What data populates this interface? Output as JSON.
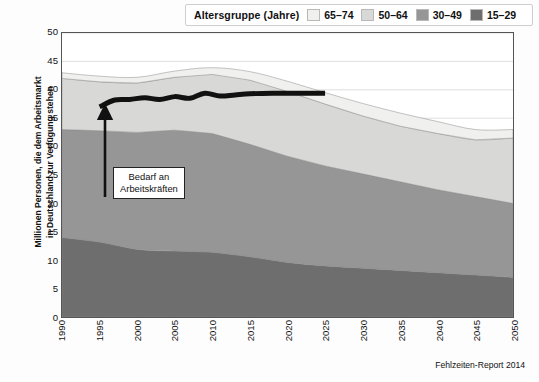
{
  "legend": {
    "title": "Altersgruppe (Jahre)",
    "items": [
      {
        "label": "65–74",
        "color": "#f0f0ee"
      },
      {
        "label": "50–64",
        "color": "#d8d8d6"
      },
      {
        "label": "30–49",
        "color": "#969696"
      },
      {
        "label": "15–29",
        "color": "#6e6e6e"
      }
    ]
  },
  "annotation": {
    "line1": "Bedarf an",
    "line2": "Arbeitskräften"
  },
  "footer": "Fehlzeiten-Report 2014",
  "chart_data": {
    "type": "area",
    "title": "",
    "xlabel": "",
    "ylabel": "Millionen Personen, die dem Arbeitsmarkt in Deutschland zur Verfügung stehen",
    "ylabel_line1": "Millionen Personen, die dem Arbeitsmarkt",
    "ylabel_line2": "in Deutschland zur Verfügung stehen",
    "stacked": true,
    "grid": true,
    "legend_position": "top",
    "xlim": [
      1990,
      2050
    ],
    "ylim": [
      0,
      50
    ],
    "yticks": [
      0,
      5,
      10,
      15,
      20,
      25,
      30,
      35,
      40,
      45,
      50
    ],
    "xticks": [
      1990,
      1995,
      2000,
      2005,
      2010,
      2015,
      2020,
      2025,
      2030,
      2035,
      2040,
      2045,
      2050
    ],
    "x": [
      1990,
      1995,
      2000,
      2005,
      2010,
      2015,
      2020,
      2025,
      2030,
      2035,
      2040,
      2045,
      2050
    ],
    "series": [
      {
        "name": "15–29",
        "color": "#6e6e6e",
        "values": [
          14.0,
          13.2,
          11.9,
          11.6,
          11.4,
          10.6,
          9.6,
          9.0,
          8.6,
          8.2,
          7.8,
          7.4,
          7.0
        ]
      },
      {
        "name": "30–49",
        "color": "#969696",
        "values": [
          19.0,
          19.6,
          20.6,
          21.3,
          20.9,
          19.8,
          18.7,
          17.6,
          16.6,
          15.6,
          14.6,
          13.8,
          13.0
        ]
      },
      {
        "name": "50–64",
        "color": "#d8d8d6",
        "values": [
          9.0,
          8.6,
          8.7,
          9.3,
          10.4,
          11.3,
          11.4,
          10.9,
          10.2,
          9.8,
          9.9,
          10.0,
          11.5
        ]
      },
      {
        "name": "65–74",
        "color": "#f0f0ee",
        "values": [
          1.0,
          1.0,
          1.0,
          1.1,
          1.2,
          1.5,
          1.8,
          2.0,
          2.2,
          2.3,
          2.1,
          1.8,
          1.5
        ]
      }
    ],
    "highlight_line": {
      "name": "Bedarf an Arbeitskräften",
      "color": "#111111",
      "x": [
        1995,
        1997,
        1999,
        2001,
        2003,
        2005,
        2007,
        2009,
        2011,
        2013,
        2015,
        2018,
        2021,
        2025
      ],
      "y": [
        37.0,
        38.2,
        38.3,
        38.6,
        38.3,
        38.8,
        38.5,
        39.4,
        38.9,
        39.1,
        39.3,
        39.4,
        39.4,
        39.4
      ]
    },
    "stack_tops": {
      "note": "cumulative totals per x",
      "values": [
        43.0,
        42.4,
        42.2,
        43.3,
        43.9,
        43.2,
        41.5,
        39.5,
        37.6,
        35.9,
        34.4,
        33.0,
        33.0
      ]
    }
  }
}
